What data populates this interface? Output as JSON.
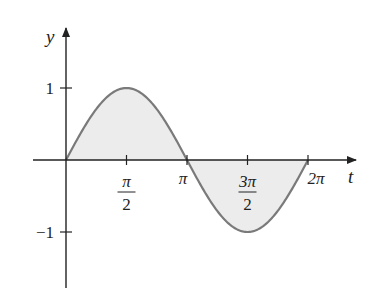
{
  "chart_data": {
    "type": "area",
    "title": "",
    "xlabel": "t",
    "ylabel": "y",
    "function": "y = sin t",
    "x": [
      0,
      0.7854,
      1.5708,
      2.3562,
      3.1416,
      3.927,
      4.7124,
      5.4978,
      6.2832
    ],
    "values": [
      0,
      0.707,
      1,
      0.707,
      0,
      -0.707,
      -1,
      -0.707,
      0
    ],
    "fill_between_curve_and_axis": true,
    "xlim": [
      -1.05,
      9.0
    ],
    "ylim": [
      -1.75,
      1.75
    ],
    "x_ticks": [
      {
        "value": 1.5708,
        "label_num": "π",
        "label_den": "2"
      },
      {
        "value": 3.1416,
        "label": "π"
      },
      {
        "value": 4.7124,
        "label_num": "3π",
        "label_den": "2"
      },
      {
        "value": 6.2832,
        "label": "2π"
      }
    ],
    "y_ticks": [
      {
        "value": 1,
        "label": "1"
      },
      {
        "value": -1,
        "label": "−1"
      }
    ],
    "grid": false,
    "legend": null,
    "colors": {
      "curve": "#7a7a7a",
      "fill": "#ececec",
      "axis": "#222222"
    }
  }
}
